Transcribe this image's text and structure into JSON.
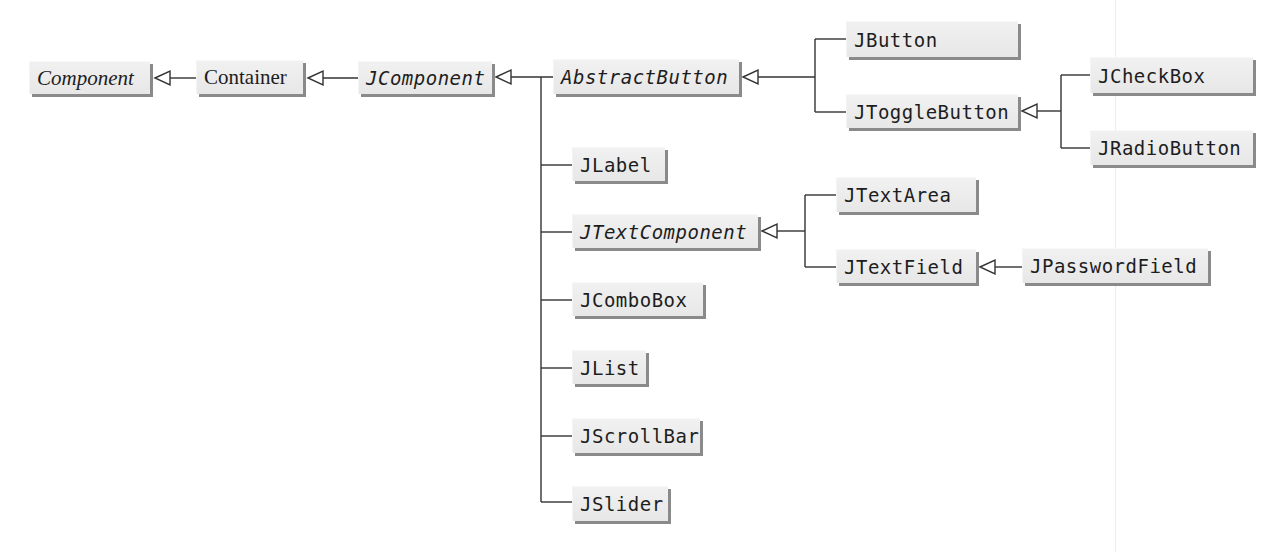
{
  "diagram": {
    "type": "class-hierarchy",
    "colors": {
      "background": "#ffffff",
      "box_fill": "#ececec",
      "box_shadow": "#8a8a8a",
      "text": "#1d1d1d",
      "line": "#333333"
    },
    "nodes": {
      "component": {
        "label": "Component",
        "abstract": true,
        "parent": null
      },
      "container": {
        "label": "Container",
        "abstract": false,
        "parent": "Component"
      },
      "jcomponent": {
        "label": "JComponent",
        "abstract": true,
        "parent": "Container"
      },
      "abstractbutton": {
        "label": "AbstractButton",
        "abstract": true,
        "parent": "JComponent"
      },
      "jbutton": {
        "label": "JButton",
        "abstract": false,
        "parent": "AbstractButton"
      },
      "jtogglebutton": {
        "label": "JToggleButton",
        "abstract": false,
        "parent": "AbstractButton"
      },
      "jcheckbox": {
        "label": "JCheckBox",
        "abstract": false,
        "parent": "JToggleButton"
      },
      "jradiobutton": {
        "label": "JRadioButton",
        "abstract": false,
        "parent": "JToggleButton"
      },
      "jlabel": {
        "label": "JLabel",
        "abstract": false,
        "parent": "JComponent"
      },
      "jtextcomponent": {
        "label": "JTextComponent",
        "abstract": true,
        "parent": "JComponent"
      },
      "jtextarea": {
        "label": "JTextArea",
        "abstract": false,
        "parent": "JTextComponent"
      },
      "jtextfield": {
        "label": "JTextField",
        "abstract": false,
        "parent": "JTextComponent"
      },
      "jpasswordfield": {
        "label": "JPasswordField",
        "abstract": false,
        "parent": "JTextField"
      },
      "jcombobox": {
        "label": "JComboBox",
        "abstract": false,
        "parent": "JComponent"
      },
      "jlist": {
        "label": "JList",
        "abstract": false,
        "parent": "JComponent"
      },
      "jscrollbar": {
        "label": "JScrollBar",
        "abstract": false,
        "parent": "JComponent"
      },
      "jslider": {
        "label": "JSlider",
        "abstract": false,
        "parent": "JComponent"
      }
    },
    "edge_style": "hollow-triangle-arrow (generalization)"
  }
}
